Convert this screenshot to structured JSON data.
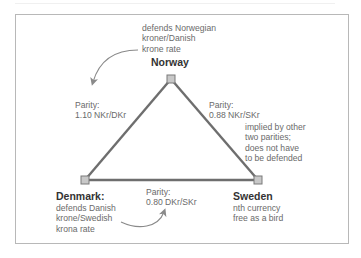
{
  "diagram": {
    "type": "triangular-currency-parity",
    "colors": {
      "frame": "#b8b8b8",
      "edge": "#6e6e6e",
      "node_fill": "#c8c8c8",
      "node_stroke": "#7a7a7a",
      "arrow": "#8a8a8a",
      "label_text": "#6a6a6a",
      "country_text": "#333333"
    },
    "nodes": {
      "norway": {
        "name": "Norway",
        "note": [
          "defends Norwegian",
          "kroner/Danish",
          "krone rate"
        ]
      },
      "denmark": {
        "name": "Denmark:",
        "note": [
          "defends Danish",
          "krone/Swedish",
          "krona rate"
        ]
      },
      "sweden": {
        "name": "Sweden",
        "note": [
          "nth currency",
          "free as a bird"
        ]
      }
    },
    "edges": {
      "norway_denmark": {
        "label": "Parity:",
        "value": "1.10 NKr/DKr"
      },
      "norway_sweden": {
        "label": "Parity:",
        "value": "0.88 NKr/SKr",
        "note": [
          "implied by other",
          "two parities;",
          "does not have",
          "to be defended"
        ]
      },
      "denmark_sweden": {
        "label": "Parity:",
        "value": "0.80 DKr/SKr"
      }
    }
  }
}
